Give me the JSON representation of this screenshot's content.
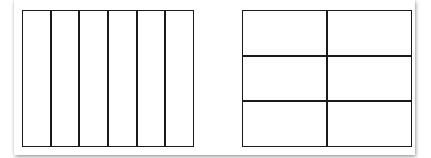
{
  "diagram": {
    "left_rectangle": {
      "description": "rectangle divided into equal vertical strips",
      "columns": 6,
      "rows": 1,
      "x": 22,
      "y": 10,
      "width": 172,
      "height": 137
    },
    "right_rectangle": {
      "description": "rectangle divided into a 2 x 3 grid",
      "columns": 2,
      "rows": 3,
      "x": 242,
      "y": 10,
      "width": 170,
      "height": 137
    },
    "colors": {
      "stroke": "#1a1a1a",
      "fill": "#ffffff",
      "background": "#ffffff"
    }
  }
}
